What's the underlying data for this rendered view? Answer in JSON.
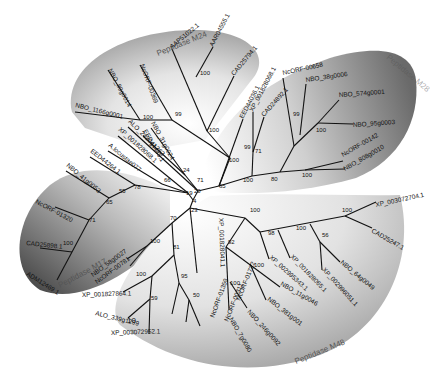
{
  "figure": {
    "type": "unrooted phylogenetic tree",
    "scale_label": "10"
  },
  "clades": [
    {
      "name": "Peptidase M24",
      "label": "Peptidase M24",
      "label_x": 158,
      "label_y": 56,
      "label_rot": -22
    },
    {
      "name": "Peptidase M28",
      "label": "Peptidase M28",
      "label_x": 404,
      "label_y": 64,
      "label_rot": 40
    },
    {
      "name": "Peptidase M17",
      "label": "Peptidase M17",
      "label_x": 94,
      "label_y": 275,
      "label_rot": -28
    },
    {
      "name": "Peptidase M48",
      "label": "Peptidase M48",
      "label_x": 300,
      "label_y": 360,
      "label_rot": -22
    }
  ],
  "leaves": [
    {
      "label": "AAP51022.1",
      "x": 172,
      "y": 49,
      "rot": -40
    },
    {
      "label": "AAR04555.1",
      "x": 213,
      "y": 47,
      "rot": -62
    },
    {
      "label": "CAD25794.1",
      "x": 234,
      "y": 76,
      "rot": -50
    },
    {
      "label": "NcORF-00369",
      "x": 140,
      "y": 65,
      "rot": 70
    },
    {
      "label": "NBO_89g0014",
      "x": 108,
      "y": 70,
      "rot": 62
    },
    {
      "label": "NBO_1166g0001",
      "x": 75,
      "y": 107,
      "rot": 14
    },
    {
      "label": "NBO_31g0024",
      "x": 151,
      "y": 123,
      "rot": 62
    },
    {
      "label": "EED44445.1",
      "x": 143,
      "y": 131,
      "rot": 60
    },
    {
      "label": "ALO_2420g1363",
      "x": 128,
      "y": 122,
      "rot": 45
    },
    {
      "label": "XP_001828068.1",
      "x": 118,
      "y": 130,
      "rot": 42
    },
    {
      "label": "A.locustae077",
      "x": 108,
      "y": 146,
      "rot": 40
    },
    {
      "label": "EED44264.1",
      "x": 90,
      "y": 152,
      "rot": 38
    },
    {
      "label": "NBO_41g0053",
      "x": 66,
      "y": 166,
      "rot": 40
    },
    {
      "label": "NcORF-01320",
      "x": 35,
      "y": 203,
      "rot": 28
    },
    {
      "label": "CAD25898.1",
      "x": 26,
      "y": 245,
      "rot": 6
    },
    {
      "label": "ADM12469.1",
      "x": 26,
      "y": 275,
      "rot": 32
    },
    {
      "label": "EED44036.1",
      "x": 243,
      "y": 119,
      "rot": -62
    },
    {
      "label": "XP_001828068.1",
      "x": 253,
      "y": 112,
      "rot": -62
    },
    {
      "label": "CAD24892.1",
      "x": 264,
      "y": 117,
      "rot": -48
    },
    {
      "label": "NcORF-00658",
      "x": 283,
      "y": 75,
      "rot": -12
    },
    {
      "label": "NBO_38g0006",
      "x": 306,
      "y": 82,
      "rot": -8
    },
    {
      "label": "NBO_574g0001",
      "x": 339,
      "y": 97,
      "rot": -4
    },
    {
      "label": "NBO_95g0003",
      "x": 353,
      "y": 127,
      "rot": -4
    },
    {
      "label": "NcORF-00142",
      "x": 343,
      "y": 157,
      "rot": -30
    },
    {
      "label": "NBO_808g0010",
      "x": 345,
      "y": 171,
      "rot": -30
    },
    {
      "label": "XP_003072704.1",
      "x": 376,
      "y": 207,
      "rot": -12
    },
    {
      "label": "CAD25247.1",
      "x": 371,
      "y": 232,
      "rot": 30
    },
    {
      "label": "NBO_64g0049",
      "x": 340,
      "y": 263,
      "rot": 40
    },
    {
      "label": "XP_002996051.1",
      "x": 322,
      "y": 270,
      "rot": 48
    },
    {
      "label": "XP_001828065.1",
      "x": 290,
      "y": 257,
      "rot": 46
    },
    {
      "label": "XP_002995343.1",
      "x": 269,
      "y": 258,
      "rot": 42
    },
    {
      "label": "NBO_11g0046",
      "x": 280,
      "y": 285,
      "rot": 30
    },
    {
      "label": "NBO_381g001",
      "x": 267,
      "y": 300,
      "rot": 38
    },
    {
      "label": "NBO_246g0092",
      "x": 247,
      "y": 312,
      "rot": 48
    },
    {
      "label": "NBO_7g0080",
      "x": 229,
      "y": 319,
      "rot": 60
    },
    {
      "label": "XP_001828041.1",
      "x": 219,
      "y": 218,
      "rot": 88
    },
    {
      "label": "NcORF-01722",
      "x": 240,
      "y": 301,
      "rot": -68
    },
    {
      "label": "NcORF-00311",
      "x": 228,
      "y": 322,
      "rot": -68
    },
    {
      "label": "NcORF-01359",
      "x": 214,
      "y": 318,
      "rot": -70
    },
    {
      "label": "XP_003072952.1",
      "x": 111,
      "y": 335,
      "rot": -2
    },
    {
      "label": "ALO_339g1299",
      "x": 95,
      "y": 315,
      "rot": 14
    },
    {
      "label": "XP_001827864.1",
      "x": 82,
      "y": 297,
      "rot": -2
    },
    {
      "label": "NcORF-00781",
      "x": 97,
      "y": 284,
      "rot": -36
    },
    {
      "label": "NBO_58g0027",
      "x": 93,
      "y": 277,
      "rot": -36
    }
  ],
  "bootstrap": [
    {
      "v": "100",
      "x": 200,
      "y": 75
    },
    {
      "v": "99",
      "x": 175,
      "y": 116
    },
    {
      "v": "100",
      "x": 143,
      "y": 119
    },
    {
      "v": "100",
      "x": 209,
      "y": 132
    },
    {
      "v": "100",
      "x": 229,
      "y": 162
    },
    {
      "v": "24",
      "x": 183,
      "y": 172
    },
    {
      "v": "71",
      "x": 197,
      "y": 182
    },
    {
      "v": "66",
      "x": 164,
      "y": 182
    },
    {
      "v": "20",
      "x": 194,
      "y": 193
    },
    {
      "v": "19",
      "x": 186,
      "y": 195
    },
    {
      "v": "4",
      "x": 193,
      "y": 203
    },
    {
      "v": "23",
      "x": 191,
      "y": 212
    },
    {
      "v": "65",
      "x": 219,
      "y": 188
    },
    {
      "v": "100",
      "x": 243,
      "y": 182
    },
    {
      "v": "71",
      "x": 255,
      "y": 153
    },
    {
      "v": "99",
      "x": 244,
      "y": 149
    },
    {
      "v": "99",
      "x": 293,
      "y": 116
    },
    {
      "v": "100",
      "x": 316,
      "y": 132
    },
    {
      "v": "80",
      "x": 271,
      "y": 181
    },
    {
      "v": "100",
      "x": 302,
      "y": 177
    },
    {
      "v": "78",
      "x": 134,
      "y": 189
    },
    {
      "v": "55",
      "x": 119,
      "y": 193
    },
    {
      "v": "65",
      "x": 106,
      "y": 204
    },
    {
      "v": "71",
      "x": 89,
      "y": 222
    },
    {
      "v": "100",
      "x": 63,
      "y": 245
    },
    {
      "v": "70",
      "x": 170,
      "y": 220
    },
    {
      "v": "100",
      "x": 150,
      "y": 243
    },
    {
      "v": "81",
      "x": 173,
      "y": 249
    },
    {
      "v": "100",
      "x": 136,
      "y": 276
    },
    {
      "v": "59",
      "x": 151,
      "y": 300
    },
    {
      "v": "95",
      "x": 181,
      "y": 278
    },
    {
      "v": "50",
      "x": 193,
      "y": 297
    },
    {
      "v": "100",
      "x": 250,
      "y": 212
    },
    {
      "v": "92",
      "x": 228,
      "y": 244
    },
    {
      "v": "98",
      "x": 268,
      "y": 235
    },
    {
      "v": "100",
      "x": 296,
      "y": 230
    },
    {
      "v": "56",
      "x": 322,
      "y": 237
    },
    {
      "v": "100",
      "x": 342,
      "y": 212
    },
    {
      "v": "100",
      "x": 254,
      "y": 267
    },
    {
      "v": "100",
      "x": 230,
      "y": 285
    }
  ],
  "colors": {
    "m24_dark": "#9a9a9a",
    "m28_dark": "#6e6e6e",
    "m17_dark": "#3f3f3f",
    "m48_dark": "#a5a5a5",
    "branch": "#111111"
  }
}
